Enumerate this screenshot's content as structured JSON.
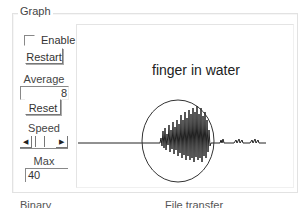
{
  "group": {
    "title": "Graph"
  },
  "controls": {
    "enable": {
      "label": "Enable",
      "checked": false
    },
    "restart_label": "Restart",
    "average": {
      "label": "Average",
      "value": "8"
    },
    "reset_label": "Reset",
    "speed": {
      "label": "Speed",
      "left_arrow": "◀",
      "right_arrow": "▶"
    },
    "max": {
      "label": "Max",
      "value": "40"
    }
  },
  "graph": {
    "annotation": "finger in water",
    "trace_color": "#222222",
    "circle_color": "#333333"
  },
  "bottom_labels": {
    "left": "Binary",
    "right": "File transfer"
  }
}
